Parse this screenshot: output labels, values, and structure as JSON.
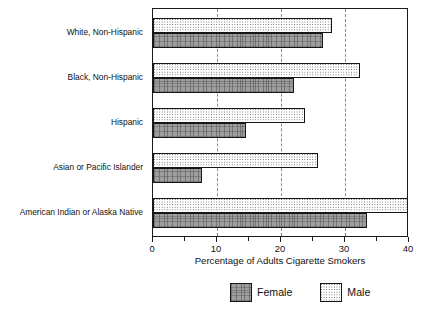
{
  "chart_data": {
    "type": "bar",
    "orientation": "horizontal",
    "title": "",
    "xlabel": "Percentage of Adults Cigarette Smokers",
    "ylabel": "",
    "xlim": [
      0,
      40
    ],
    "xticks": [
      0,
      10,
      20,
      30,
      40
    ],
    "xtick_labels": [
      "0",
      "10",
      "20",
      "30",
      "40"
    ],
    "minor_xticks": [
      5,
      15,
      25,
      35
    ],
    "grid": "vertical dashed gridlines at 10, 20, 30",
    "legend_position": "bottom-center",
    "categories": [
      "White, Non-Hispanic",
      "Black, Non-Hispanic",
      "Hispanic",
      "Asian or Pacific Islander",
      "American Indian or Alaska Native"
    ],
    "series": [
      {
        "name": "Male",
        "values": [
          27.9,
          32.3,
          23.7,
          25.8,
          40.0
        ],
        "pattern": "dotted-white",
        "color": "#ffffff"
      },
      {
        "name": "Female",
        "values": [
          26.5,
          22.0,
          14.5,
          7.7,
          33.5
        ],
        "pattern": "gray-crosshatch",
        "color": "#9e9e9e"
      }
    ]
  },
  "axis": {
    "x_title": "Percentage of Adults Cigarette Smokers",
    "tick_labels": [
      "0",
      "10",
      "20",
      "30",
      "40"
    ]
  },
  "legend": {
    "items": [
      {
        "label": "Female",
        "swatch": "female-swatch"
      },
      {
        "label": "Male",
        "swatch": "male-swatch"
      }
    ]
  },
  "colors": {
    "frame": "#1a1a1a",
    "gridline": "#8a8a8a",
    "female_fill": "#9e9e9e",
    "male_fill": "#ffffff",
    "text": "#111111"
  }
}
